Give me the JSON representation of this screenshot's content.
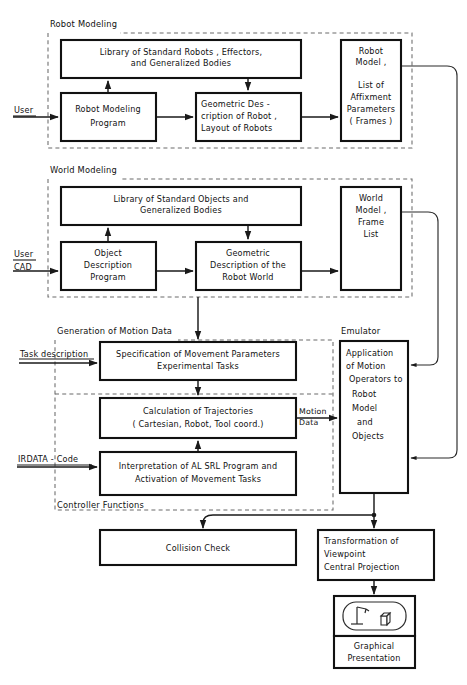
{
  "diagram": {
    "type": "block-flow-diagram",
    "groups": {
      "robot_modeling": {
        "label": "Robot Modeling"
      },
      "world_modeling": {
        "label": "World Modeling"
      },
      "motion_data": {
        "label": "Generation of Motion Data"
      },
      "controller_functions": {
        "label": "Controller Functions"
      },
      "emulator": {
        "label": "Emulator"
      }
    },
    "inputs": {
      "user_robot": {
        "label": "User"
      },
      "user_cad_line1": {
        "label": "User"
      },
      "user_cad_line2": {
        "label": "CAD"
      },
      "task_description": {
        "label": "Task description"
      },
      "irdata_code": {
        "label": "IRDATA - Code"
      }
    },
    "edge_labels": {
      "motion_data_line1": {
        "label": "Motion"
      },
      "motion_data_line2": {
        "label": "Data"
      }
    },
    "boxes": {
      "library_robots": {
        "lines": [
          "Library of Standard Robots ,  Effectors,",
          "and Generalized Bodies"
        ]
      },
      "robot_modeling_program": {
        "lines": [
          "Robot Modeling",
          "Program"
        ]
      },
      "geometric_description_robot": {
        "lines": [
          "Geometric   Des -",
          "cription of Robot ,",
          "Layout of Robots"
        ]
      },
      "robot_model": {
        "lines": [
          "Robot",
          "Model ,",
          "",
          "List of",
          "Affixment",
          "Parameters",
          "( Frames )"
        ]
      },
      "library_objects": {
        "lines": [
          "Library  of  Standard  Objects  and",
          "Generalized  Bodies"
        ]
      },
      "object_description_program": {
        "lines": [
          "Object",
          "Description",
          "Program"
        ]
      },
      "geometric_description_world": {
        "lines": [
          "Geometric",
          "Description  of the",
          "Robot  World"
        ]
      },
      "world_model": {
        "lines": [
          "World",
          "Model ,",
          "Frame",
          "List"
        ]
      },
      "specification_movement": {
        "lines": [
          "Specification  of  Movement  Parameters",
          "Experimental    Tasks"
        ]
      },
      "calculation_trajectories": {
        "lines": [
          "Calculation   of  Trajectories",
          "( Cartesian,  Robot,  Tool  coord.)"
        ]
      },
      "interpretation_al_srl": {
        "lines": [
          "Interpretation  of  AL SRL Program  and",
          "Activation  of  Movement  Tasks"
        ]
      },
      "emulator_application": {
        "lines": [
          "Application",
          "of  Motion",
          "Operators to",
          "Robot",
          "Model",
          "and",
          "Objects"
        ]
      },
      "collision_check": {
        "lines": [
          "Collision   Check"
        ]
      },
      "transformation_viewpoint": {
        "lines": [
          "Transformation  of",
          "Viewpoint",
          "Central  Projection"
        ]
      },
      "graphical_presentation": {
        "lines": [
          "Graphical",
          "Presentation"
        ]
      }
    },
    "icons": {
      "robot_scene": {
        "name": "robot-arm-and-object-icon"
      }
    },
    "colors": {
      "line": "#111111",
      "dashed_group": "#6b6b6b",
      "background": "#ffffff"
    }
  }
}
